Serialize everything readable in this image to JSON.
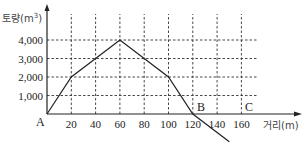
{
  "chart_data": {
    "type": "line",
    "title": "",
    "xlabel": "거리(m)",
    "ylabel": "토량(m³)",
    "xlim": [
      0,
      170
    ],
    "ylim": [
      -1600,
      4800
    ],
    "x_ticks": [
      20,
      40,
      60,
      80,
      100,
      120,
      140,
      160
    ],
    "x_tick_labels": [
      "20",
      "40",
      "60",
      "80",
      "100",
      "120",
      "140",
      "160"
    ],
    "y_ticks": [
      1000,
      2000,
      3000,
      4000
    ],
    "y_tick_labels": [
      "1,000",
      "2,000",
      "3,000",
      "4,000"
    ],
    "grid": true,
    "series": [
      {
        "name": "토량 누가곡선",
        "x": [
          0,
          20,
          40,
          60,
          80,
          100,
          120,
          150
        ],
        "y": [
          0,
          2000,
          3000,
          4000,
          3000,
          2000,
          0,
          -1500
        ]
      }
    ],
    "annotations": [
      {
        "text": "A",
        "x": 0,
        "y": 0
      },
      {
        "text": "B",
        "x": 120,
        "y": 0
      },
      {
        "text": "C",
        "x": 160,
        "y": 0
      }
    ]
  },
  "labels": {
    "y_axis": "토량(m",
    "y_axis_sup": "3",
    "y_axis_close": ")",
    "x_axis": "거리(m)",
    "point_a": "A",
    "point_b": "B",
    "point_c": "C"
  }
}
